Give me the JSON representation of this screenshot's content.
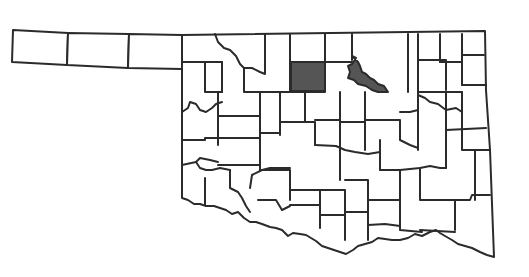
{
  "map": {
    "title": "Oklahoma county distribution map",
    "state": "Oklahoma",
    "highlight_color": "#555555",
    "outline_color": "#2b2b2b",
    "background_color": "#ffffff",
    "highlighted_counties": [
      {
        "name": "Garfield",
        "region": "north-central"
      },
      {
        "name": "Pawnee",
        "region": "north-central-east"
      }
    ]
  }
}
